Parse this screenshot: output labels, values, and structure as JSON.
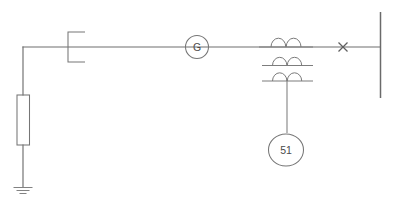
{
  "diagram": {
    "type": "electrical-single-line",
    "background_color": "#ffffff",
    "line_color": "#6e6e6e",
    "label_color": "#4a4a4a",
    "canvas": {
      "width": 394,
      "height": 204
    }
  },
  "labels": {
    "generator": "G",
    "relay": "51"
  },
  "components": [
    {
      "id": "generator",
      "name": "generator",
      "symbol": "circle",
      "label": "G",
      "center_x": 197,
      "center_y": 47,
      "radius": 11
    },
    {
      "id": "overcurrent-relay",
      "name": "overcurrent-relay-51",
      "symbol": "circle",
      "label": "51",
      "center_x": 285,
      "center_y": 150,
      "radius": 17
    },
    {
      "id": "neutral-grounding-resistor",
      "name": "neutral-grounding-resistor",
      "symbol": "rectangle",
      "label": "",
      "x": 17,
      "y": 95,
      "width": 12,
      "height": 50
    },
    {
      "id": "disconnect-bracket",
      "name": "disconnect-bracket",
      "symbol": "bracket",
      "label": "",
      "x": 68,
      "y": 32,
      "width": 17,
      "height": 30
    },
    {
      "id": "fuse-x-mark",
      "name": "fuse-x-mark",
      "symbol": "x",
      "label": "",
      "center_x": 343,
      "center_y": 47,
      "size": 9
    },
    {
      "id": "current-transformer-1",
      "name": "current-transformer-winding-1",
      "symbol": "coil",
      "label": "",
      "line_y": 47,
      "x_start": 259,
      "x_end": 313,
      "humps": 2
    },
    {
      "id": "current-transformer-2",
      "name": "current-transformer-winding-2",
      "symbol": "coil",
      "label": "",
      "line_y": 66,
      "x_start": 262,
      "x_end": 313,
      "humps": 2
    },
    {
      "id": "current-transformer-3",
      "name": "current-transformer-winding-3",
      "symbol": "coil",
      "label": "",
      "line_y": 82,
      "x_start": 262,
      "x_end": 313,
      "humps": 2
    },
    {
      "id": "ground",
      "name": "earth-ground",
      "symbol": "ground",
      "label": "",
      "center_x": 23,
      "top_y": 186,
      "bars": 3
    },
    {
      "id": "main-bus",
      "name": "vertical-bus-bar",
      "symbol": "bus",
      "label": "",
      "x": 380,
      "y_start": 12,
      "y_end": 98
    }
  ],
  "conductors": [
    {
      "name": "main-horizontal-bus-line",
      "points": "23,47 380,47"
    },
    {
      "name": "generator-neutral-drop",
      "points": "23,47 23,95"
    },
    {
      "name": "resistor-to-ground-lead",
      "points": "23,145 23,186"
    },
    {
      "name": "ct-secondary-tap-to-relay",
      "points": "287,82 287,133"
    }
  ]
}
